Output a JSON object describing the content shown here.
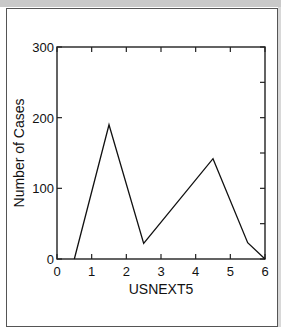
{
  "chart_data": {
    "type": "line",
    "title": "",
    "xlabel": "USNEXT5",
    "ylabel": "Number of Cases",
    "xlim": [
      0,
      6
    ],
    "ylim": [
      0,
      300
    ],
    "xticks": [
      "0",
      "1",
      "2",
      "3",
      "4",
      "5",
      "6"
    ],
    "yticks": [
      "0",
      "100",
      "200",
      "300"
    ],
    "grid": false,
    "legend": null,
    "x": [
      0.5,
      1.5,
      2.5,
      4.5,
      5.5,
      6.0
    ],
    "series": [
      {
        "name": "Number of Cases",
        "values": [
          0,
          190,
          22,
          142,
          23,
          0
        ]
      }
    ]
  },
  "colors": {
    "line": "#111111",
    "frame": "#222222",
    "panel_border": "#555555",
    "top_band": "#c9c9c9"
  }
}
